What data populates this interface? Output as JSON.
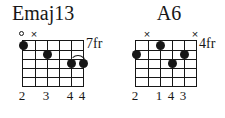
{
  "page": {
    "background_color": "#ffffff",
    "ink_color": "#171717",
    "width": 225,
    "height": 118
  },
  "chord_diagrams": [
    {
      "id": "emaj13",
      "name": "Emaj13",
      "fret_position_label": "7fr",
      "strings": 6,
      "frets": 5,
      "string_markers": [
        {
          "string": 1,
          "type": "open",
          "glyph": "open-circle-icon"
        },
        {
          "string": 2,
          "type": "muted",
          "glyph": "×"
        }
      ],
      "dots": [
        {
          "string": 1,
          "fret": 1
        },
        {
          "string": 3,
          "fret": 2
        },
        {
          "string": 5,
          "fret": 3
        },
        {
          "string": 6,
          "fret": 3
        }
      ],
      "arc": {
        "from_string": 5,
        "to_string": 6,
        "fret": 3
      },
      "finger_numbers": [
        {
          "string": 1,
          "label": "2"
        },
        {
          "string": 3,
          "label": "3"
        },
        {
          "string": 5,
          "label": "4"
        },
        {
          "string": 6,
          "label": "4"
        }
      ]
    },
    {
      "id": "a6",
      "name": "A6",
      "fret_position_label": "4fr",
      "strings": 6,
      "frets": 5,
      "string_markers": [
        {
          "string": 2,
          "type": "muted",
          "glyph": "×"
        },
        {
          "string": 6,
          "type": "muted",
          "glyph": "×"
        }
      ],
      "dots": [
        {
          "string": 1,
          "fret": 2
        },
        {
          "string": 3,
          "fret": 1
        },
        {
          "string": 4,
          "fret": 3
        },
        {
          "string": 5,
          "fret": 2
        }
      ],
      "arc": null,
      "finger_numbers": [
        {
          "string": 1,
          "label": "2"
        },
        {
          "string": 3,
          "label": "1"
        },
        {
          "string": 4,
          "label": "4"
        },
        {
          "string": 5,
          "label": "3"
        }
      ]
    }
  ]
}
